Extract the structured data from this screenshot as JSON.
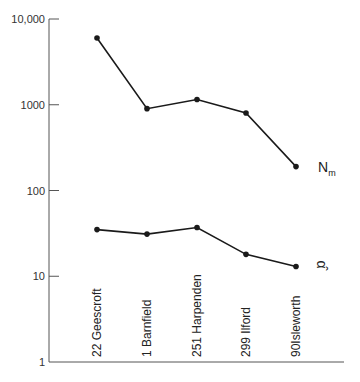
{
  "chart_data": {
    "type": "line",
    "title": "",
    "xlabel": "",
    "ylabel": "",
    "yscale": "log",
    "ylim": [
      1,
      10000
    ],
    "yticks": [
      {
        "value": 10000,
        "label": "10,000"
      },
      {
        "value": 1000,
        "label": "1000"
      },
      {
        "value": 100,
        "label": "100"
      },
      {
        "value": 10,
        "label": "10"
      },
      {
        "value": 1,
        "label": "1"
      }
    ],
    "categories": [
      "22 Geescroft",
      "1  Barnfield",
      "251 Harpenden",
      "299 Ilford",
      "90Isleworth"
    ],
    "series": [
      {
        "name": "N_m",
        "label_main": "N",
        "label_sub": "m",
        "values": [
          6000,
          900,
          1150,
          800,
          190
        ]
      },
      {
        "name": "α̂",
        "label_main": "α̂",
        "label_sub": "",
        "values": [
          35,
          31,
          37,
          18,
          13
        ]
      }
    ],
    "grid": false,
    "legend": "inline labels at right end of each series"
  },
  "colors": {
    "line": "#1a1a1a",
    "axis": "#555555"
  }
}
